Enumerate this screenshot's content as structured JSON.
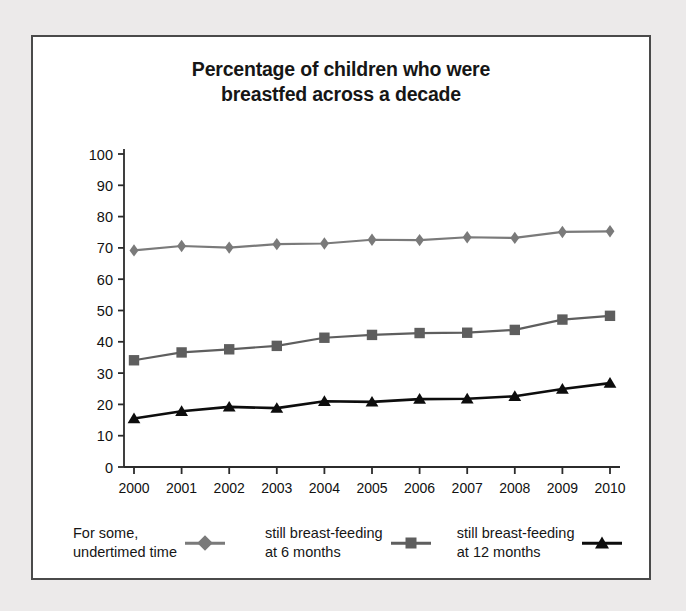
{
  "chart_data": {
    "type": "line",
    "title": "Percentage of children who were breastfed across a decade",
    "title_line1": "Percentage of children who were",
    "title_line2": "breastfed across a decade",
    "xlabel": "",
    "ylabel": "",
    "categories": [
      "2000",
      "2001",
      "2002",
      "2003",
      "2004",
      "2005",
      "2006",
      "2007",
      "2008",
      "2009",
      "2010"
    ],
    "ylim": [
      0,
      100
    ],
    "ytick_step": 10,
    "yticks": [
      "0",
      "10",
      "20",
      "30",
      "40",
      "50",
      "60",
      "70",
      "80",
      "90",
      "100"
    ],
    "grid": false,
    "legend_position": "bottom",
    "series": [
      {
        "name": "For some, undertimed time",
        "legend_line1": "For some,",
        "legend_line2": "undertimed time",
        "marker": "diamond",
        "color": "#7a7a7a",
        "values": [
          69.2,
          70.6,
          70.1,
          71.2,
          71.4,
          72.6,
          72.5,
          73.4,
          73.2,
          75.1,
          75.3
        ]
      },
      {
        "name": "still breast-feeding at 6 months",
        "legend_line1": "still breast-feeding",
        "legend_line2": "at 6 months",
        "marker": "square",
        "color": "#5e5e5e",
        "values": [
          34.1,
          36.6,
          37.6,
          38.7,
          41.3,
          42.2,
          42.8,
          42.9,
          43.8,
          47.1,
          48.3
        ]
      },
      {
        "name": "still breast-feeding at 12 months",
        "legend_line1": "still breast-feeding",
        "legend_line2": "at 12 months",
        "marker": "triangle",
        "color": "#0d0d0d",
        "values": [
          15.5,
          17.8,
          19.2,
          18.8,
          21.0,
          20.8,
          21.7,
          21.8,
          22.6,
          24.9,
          26.8
        ]
      }
    ]
  },
  "frame": {
    "border_color": "#4a4a4a",
    "background": "#ffffff",
    "page_background": "#eceaea"
  }
}
